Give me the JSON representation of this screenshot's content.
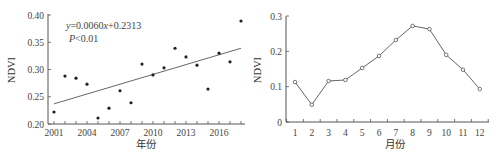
{
  "chart_data": [
    {
      "type": "scatter",
      "title": "",
      "xlabel": "年份",
      "ylabel": "NDVI",
      "xlim": [
        2001,
        2018
      ],
      "ylim": [
        0.2,
        0.4
      ],
      "x_ticks": [
        "2001",
        "2004",
        "2007",
        "2010",
        "2013",
        "2016"
      ],
      "y_ticks": [
        "0.20",
        "0.25",
        "0.30",
        "0.35",
        "0.40"
      ],
      "x": [
        2001,
        2002,
        2003,
        2004,
        2005,
        2006,
        2007,
        2008,
        2009,
        2010,
        2011,
        2012,
        2013,
        2014,
        2015,
        2016,
        2017,
        2018
      ],
      "values": [
        0.222,
        0.288,
        0.284,
        0.273,
        0.211,
        0.229,
        0.261,
        0.239,
        0.31,
        0.29,
        0.303,
        0.339,
        0.323,
        0.308,
        0.264,
        0.33,
        0.314,
        0.389
      ],
      "trendline": {
        "slope": 0.006,
        "intercept": 0.2313,
        "start": [
          2001,
          0.237
        ],
        "end": [
          2018,
          0.339
        ]
      },
      "annotations": {
        "equation_y": "y",
        "equation_rest": "=0.0060",
        "equation_x": "x",
        "equation_tail": "+0.2313",
        "p_symbol": "P",
        "p_value": "<0.01"
      },
      "grid": false,
      "legend": null
    },
    {
      "type": "line",
      "title": "",
      "xlabel": "月份",
      "ylabel": "NDVI",
      "ylim": [
        0,
        0.3
      ],
      "categories": [
        "1",
        "2",
        "3",
        "4",
        "5",
        "6",
        "7",
        "8",
        "9",
        "10",
        "11",
        "12"
      ],
      "y_ticks": [
        "0",
        "0.1",
        "0.2",
        "0.3"
      ],
      "values": [
        0.113,
        0.049,
        0.116,
        0.119,
        0.153,
        0.187,
        0.232,
        0.272,
        0.263,
        0.19,
        0.148,
        0.093
      ],
      "marker": "open-circle",
      "grid": false,
      "legend": null
    }
  ]
}
